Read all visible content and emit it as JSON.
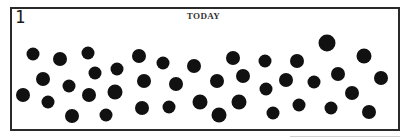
{
  "panel": {
    "number": "1",
    "title": "TODAY",
    "border_color": "#2a2a2a",
    "dot_color": "#111111"
  },
  "dots": [
    {
      "cx": 33,
      "cy": 54,
      "r": 6.5
    },
    {
      "cx": 60,
      "cy": 59,
      "r": 7
    },
    {
      "cx": 88,
      "cy": 53,
      "r": 6.5
    },
    {
      "cx": 43,
      "cy": 79,
      "r": 7
    },
    {
      "cx": 95,
      "cy": 73,
      "r": 6.5
    },
    {
      "cx": 69,
      "cy": 86,
      "r": 6.5
    },
    {
      "cx": 23,
      "cy": 95,
      "r": 7
    },
    {
      "cx": 48,
      "cy": 102,
      "r": 6.5
    },
    {
      "cx": 89,
      "cy": 95,
      "r": 7
    },
    {
      "cx": 72,
      "cy": 116,
      "r": 7
    },
    {
      "cx": 139,
      "cy": 56,
      "r": 7
    },
    {
      "cx": 163,
      "cy": 63,
      "r": 6.5
    },
    {
      "cx": 117,
      "cy": 69,
      "r": 6.5
    },
    {
      "cx": 144,
      "cy": 81,
      "r": 7
    },
    {
      "cx": 176,
      "cy": 84,
      "r": 7
    },
    {
      "cx": 115,
      "cy": 92,
      "r": 7.5
    },
    {
      "cx": 142,
      "cy": 108,
      "r": 7
    },
    {
      "cx": 169,
      "cy": 107,
      "r": 6.5
    },
    {
      "cx": 106,
      "cy": 115,
      "r": 6.5
    },
    {
      "cx": 194,
      "cy": 66,
      "r": 7
    },
    {
      "cx": 233,
      "cy": 58,
      "r": 7
    },
    {
      "cx": 265,
      "cy": 61,
      "r": 6.5
    },
    {
      "cx": 217,
      "cy": 81,
      "r": 7
    },
    {
      "cx": 243,
      "cy": 76,
      "r": 7
    },
    {
      "cx": 266,
      "cy": 89,
      "r": 6.5
    },
    {
      "cx": 200,
      "cy": 102,
      "r": 7.5
    },
    {
      "cx": 239,
      "cy": 102,
      "r": 7.5
    },
    {
      "cx": 219,
      "cy": 115,
      "r": 7.5
    },
    {
      "cx": 273,
      "cy": 113,
      "r": 6.5
    },
    {
      "cx": 327,
      "cy": 43,
      "r": 8.5
    },
    {
      "cx": 364,
      "cy": 56,
      "r": 7.5
    },
    {
      "cx": 297,
      "cy": 61,
      "r": 7
    },
    {
      "cx": 286,
      "cy": 80,
      "r": 7
    },
    {
      "cx": 314,
      "cy": 82,
      "r": 6.5
    },
    {
      "cx": 338,
      "cy": 74,
      "r": 7
    },
    {
      "cx": 381,
      "cy": 78,
      "r": 7
    },
    {
      "cx": 352,
      "cy": 93,
      "r": 7
    },
    {
      "cx": 299,
      "cy": 105,
      "r": 6.5
    },
    {
      "cx": 331,
      "cy": 108,
      "r": 6.5
    },
    {
      "cx": 369,
      "cy": 112,
      "r": 7
    }
  ]
}
